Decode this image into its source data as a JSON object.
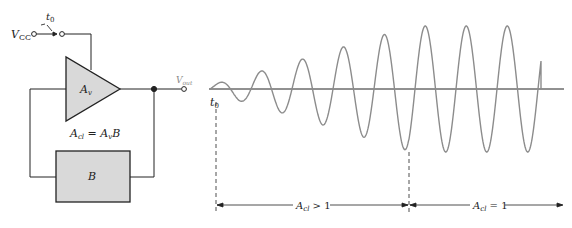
{
  "circuit": {
    "supply_label": "V",
    "supply_subscript": "CC",
    "switch_label": "t",
    "switch_subscript": "0",
    "amplifier_label": "A",
    "amplifier_subscript": "v",
    "output_label": "V",
    "output_subscript": "out",
    "equation": {
      "lhs": "A",
      "lhs_sub": "cl",
      "eq": " = ",
      "rhs": "A",
      "rhs_sub": "v",
      "rhs_tail": "B"
    },
    "feedback_label": "B",
    "colors": {
      "fill": "#d9d9d9",
      "stroke": "#222222",
      "output_label": "#8a8a8a"
    }
  },
  "waveform": {
    "t0_label": "t",
    "t0_subscript": "0",
    "regions": [
      {
        "label": "A",
        "label_sub": "cl",
        "label_tail": " > 1"
      },
      {
        "label": "A",
        "label_sub": "cl",
        "label_tail": " = 1"
      }
    ],
    "colors": {
      "wave": "#8c8c8c",
      "axis": "#222222"
    }
  }
}
